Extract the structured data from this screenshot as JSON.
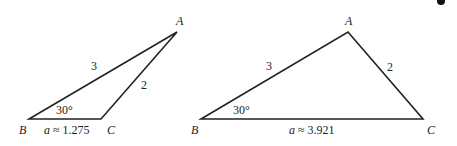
{
  "figure": {
    "triangles": [
      {
        "id": "triangle-1",
        "vertices": {
          "A": "A",
          "B": "B",
          "C": "C"
        },
        "side_AB": "3",
        "side_AC": "2",
        "angle_B": "30°",
        "side_a_label": "a ≈ 1.275"
      },
      {
        "id": "triangle-2",
        "vertices": {
          "A": "A",
          "B": "B",
          "C": "C"
        },
        "side_AB": "3",
        "side_AC": "2",
        "angle_B": "30°",
        "side_a_label": "a ≈ 3.921"
      }
    ]
  }
}
